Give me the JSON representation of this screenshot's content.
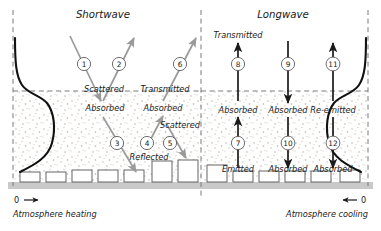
{
  "figure": {
    "headers": {
      "left": "Shortwave",
      "right": "Longwave"
    },
    "axis": {
      "left_zero": "0",
      "left_label": "Atmosphere heating",
      "right_zero": "0",
      "right_label": "Atmosphere cooling"
    },
    "colors": {
      "shortwave_arrow": "#9a9a9a",
      "longwave_arrow": "#1a1a1a",
      "profile_curve": "#111111",
      "dashed_boundary": "#7a7a7a",
      "canopy_speckle": "#b9b2a8",
      "ground": "#c9c9c9",
      "building_outline": "#555555",
      "text": "#1a1a1a"
    },
    "flows": [
      {
        "id": "1",
        "number": "1",
        "band": "shortwave",
        "direction": "down-right",
        "label": "Absorbed",
        "label_pos": "below"
      },
      {
        "id": "2",
        "number": "2",
        "band": "shortwave",
        "direction": "up-right",
        "label": "Scattered",
        "label_pos": "above"
      },
      {
        "id": "3",
        "number": "3",
        "band": "shortwave",
        "direction": "down-right",
        "label": "Reflected",
        "label_pos": "below"
      },
      {
        "id": "4",
        "number": "4",
        "band": "shortwave",
        "direction": "up-right",
        "label": "Absorbed",
        "label_pos": "above"
      },
      {
        "id": "5",
        "number": "5",
        "band": "shortwave",
        "direction": "down-right",
        "label": "Scattered",
        "label_pos": "above"
      },
      {
        "id": "6",
        "number": "6",
        "band": "shortwave",
        "direction": "up-right",
        "label": "Transmitted",
        "label_pos": "below"
      },
      {
        "id": "7",
        "number": "7",
        "band": "longwave",
        "direction": "up",
        "label": "Emitted",
        "label_pos": "below"
      },
      {
        "id": "8",
        "number": "8",
        "band": "longwave",
        "direction": "up",
        "label": "Transmitted",
        "label_pos": "above"
      },
      {
        "id": "9",
        "number": "9",
        "band": "longwave",
        "direction": "down",
        "label": "Absorbed",
        "label_pos": "below"
      },
      {
        "id": "10",
        "number": "10",
        "band": "longwave",
        "direction": "down",
        "label": "Absorbed",
        "label_pos": "below"
      },
      {
        "id": "11",
        "number": "11",
        "band": "longwave",
        "direction": "up",
        "label": "Re-emitted",
        "label_pos": "below"
      },
      {
        "id": "12",
        "number": "12",
        "band": "longwave",
        "direction": "down",
        "label": "Absorbed",
        "label_pos": "below"
      }
    ],
    "inline_labels": {
      "sw_scattered_top": "Scattered",
      "sw_transmitted_top": "Transmitted",
      "sw_absorbed_left": "Absorbed",
      "sw_absorbed_mid": "Absorbed",
      "sw_scattered_mid": "Scattered",
      "sw_reflected": "Reflected",
      "lw_transmitted": "Transmitted",
      "lw_absorbed_8": "Absorbed",
      "lw_absorbed_9": "Absorbed",
      "lw_reemitted_11": "Re-emitted",
      "lw_emitted_7": "Emitted",
      "lw_absorbed_10": "Absorbed",
      "lw_absorbed_12": "Absorbed"
    }
  }
}
